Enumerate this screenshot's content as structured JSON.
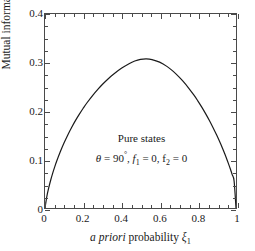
{
  "chart_data": {
    "type": "line",
    "title": "",
    "xlabel": "a priori probability ξ₁",
    "ylabel": "Mutual information [bit]",
    "xlim": [
      0,
      1
    ],
    "ylim": [
      0,
      0.4
    ],
    "grid": false,
    "legend": null,
    "xticks": [
      0,
      0.2,
      0.4,
      0.6,
      0.8,
      1
    ],
    "xticklabels": [
      "0",
      "0.2",
      "0.4",
      "0.6",
      "0.8",
      "1"
    ],
    "yticks": [
      0,
      0.1,
      0.2,
      0.3,
      0.4
    ],
    "yticklabels": [
      "0",
      "0.1",
      "0.2",
      "0.3",
      "0.4"
    ],
    "minor_tick_step_x": 0.05,
    "minor_tick_step_y": 0.025,
    "line_color": "#1a1a1a",
    "line_width": 1.2,
    "series": [
      {
        "name": "Mutual information, pure states",
        "x": [
          0.0,
          0.01,
          0.02,
          0.03,
          0.04,
          0.05,
          0.06,
          0.08,
          0.1,
          0.12,
          0.14,
          0.16,
          0.18,
          0.2,
          0.22,
          0.25,
          0.28,
          0.3,
          0.33,
          0.36,
          0.4,
          0.44,
          0.47,
          0.5,
          0.53,
          0.56,
          0.6,
          0.64,
          0.67,
          0.7,
          0.72,
          0.75,
          0.78,
          0.8,
          0.82,
          0.84,
          0.86,
          0.88,
          0.9,
          0.92,
          0.94,
          0.95,
          0.96,
          0.97,
          0.98,
          0.99,
          1.0
        ],
        "y": [
          0.0,
          0.0246,
          0.0424,
          0.0578,
          0.0714,
          0.0838,
          0.0953,
          0.116,
          0.1345,
          0.1512,
          0.1665,
          0.1806,
          0.1936,
          0.2057,
          0.217,
          0.2324,
          0.2462,
          0.2546,
          0.266,
          0.2761,
          0.2879,
          0.2975,
          0.303,
          0.3063,
          0.3073,
          0.306,
          0.3007,
          0.2915,
          0.2822,
          0.2709,
          0.2625,
          0.2484,
          0.2326,
          0.221,
          0.2085,
          0.1951,
          0.1809,
          0.1656,
          0.1493,
          0.1318,
          0.1128,
          0.1027,
          0.0921,
          0.0809,
          0.0689,
          0.0558,
          0.0
        ]
      }
    ],
    "annotations": [
      {
        "text": "Pure states",
        "x": 0.5,
        "y": 0.145
      },
      {
        "text": "θ = 90°, f₁ = 0, f₂ = 0",
        "x": 0.5,
        "y": 0.108
      }
    ],
    "peak": {
      "x": 0.5,
      "y": 0.3974
    }
  },
  "axes": {
    "ylabel": "Mutual information [bit]",
    "xlabel_italic": "a priori",
    "xlabel_rest": "probability",
    "xlabel_symbol": "ξ",
    "xlabel_symbol_sub": "1"
  },
  "annotations": {
    "title_text": "Pure states",
    "theta_symbol": "θ",
    "theta_eq": " = 90",
    "theta_deg": "°",
    "f1_text": ", f",
    "f1_sub": "1",
    "f1_eq": " = 0, f",
    "f2_sub": "2",
    "f2_eq": " = 0"
  },
  "colors": {
    "curve": "#1a1a1a",
    "frame": "#4a4a4a",
    "background": "#ffffff",
    "text": "#1a1a1a"
  }
}
